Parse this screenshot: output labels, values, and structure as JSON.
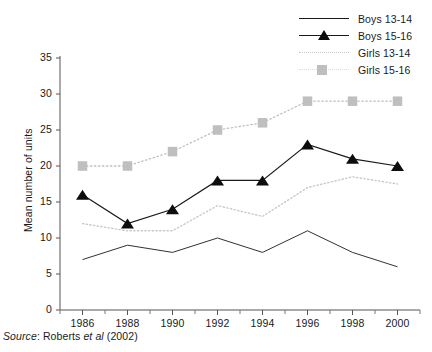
{
  "chart_data": {
    "type": "line",
    "title": "",
    "xlabel": "",
    "ylabel": "Mean number of units",
    "categories": [
      "1986",
      "1988",
      "1990",
      "1992",
      "1994",
      "1996",
      "1998",
      "2000"
    ],
    "x": [
      1986,
      1988,
      1990,
      1992,
      1994,
      1996,
      1998,
      2000
    ],
    "xlim": [
      1985,
      2001
    ],
    "ylim": [
      0,
      35
    ],
    "yticks": [
      "0",
      "5",
      "10",
      "15",
      "20",
      "25",
      "30",
      "35"
    ],
    "ytick_values": [
      0,
      5,
      10,
      15,
      20,
      25,
      30,
      35
    ],
    "grid": false,
    "legend_position": "top-right",
    "series": [
      {
        "name": "Boys 13-14",
        "style": "thin-solid-line",
        "color": "#1a1a1a",
        "marker": "none",
        "values": [
          7,
          9,
          8,
          10,
          8,
          11,
          8,
          6
        ]
      },
      {
        "name": "Boys 15-16",
        "style": "solid-line-with-markers",
        "color": "#1a1a1a",
        "marker": "triangle",
        "values": [
          16,
          12,
          14,
          18,
          18,
          23,
          21,
          20
        ]
      },
      {
        "name": "Girls 13-14",
        "style": "dotted-line",
        "color": "#c9c9c9",
        "marker": "none",
        "values": [
          12,
          11,
          11,
          14.5,
          13,
          17,
          18.5,
          17.5
        ]
      },
      {
        "name": "Girls 15-16",
        "style": "dotted-line-with-markers",
        "color": "#bfbfbf",
        "marker": "square",
        "values": [
          20,
          20,
          22,
          25,
          26,
          29,
          29,
          29
        ]
      }
    ]
  },
  "legend": {
    "items": [
      {
        "label": "Boys 13-14",
        "key": "thin-line-key"
      },
      {
        "label": "Boys 15-16",
        "key": "line-triangle-key"
      },
      {
        "label": "Girls 13-14",
        "key": "dotted-line-key"
      },
      {
        "label": "Girls 15-16",
        "key": "gray-square-key"
      }
    ]
  },
  "axes": {
    "y_label": "Mean number of units",
    "y_ticks": [
      "35",
      "30",
      "25",
      "20",
      "15",
      "10",
      "5",
      "0"
    ],
    "x_ticks": [
      "1986",
      "1988",
      "1990",
      "1992",
      "1994",
      "1996",
      "1998",
      "2000"
    ]
  },
  "caption": {
    "prefix": "Source",
    "colon": ": ",
    "author": "Roberts ",
    "etal": "et al",
    "year": " (2002)",
    "full": "Source: Roberts et al (2002)"
  }
}
